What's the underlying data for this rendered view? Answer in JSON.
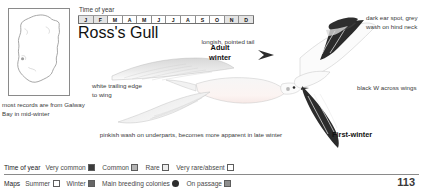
{
  "page": {
    "number": "113"
  },
  "map": {
    "caption": "most records are from Galway Bay in mid-winter"
  },
  "time_of_year": {
    "label": "Time of year",
    "months": [
      {
        "letter": "J",
        "level": 1
      },
      {
        "letter": "F",
        "level": 1
      },
      {
        "letter": "M",
        "level": 0
      },
      {
        "letter": "A",
        "level": 0
      },
      {
        "letter": "M",
        "level": 0
      },
      {
        "letter": "J",
        "level": 0
      },
      {
        "letter": "J",
        "level": 0
      },
      {
        "letter": "A",
        "level": 0
      },
      {
        "letter": "S",
        "level": 0
      },
      {
        "letter": "O",
        "level": 0
      },
      {
        "letter": "N",
        "level": 1
      },
      {
        "letter": "D",
        "level": 1
      }
    ]
  },
  "species": {
    "title": "Ross's Gull"
  },
  "annotations": {
    "adult_winter": "Adult\nwinter",
    "adult_winter_line1": "Adult",
    "adult_winter_line2": "winter",
    "first_winter": "First-winter",
    "white_trailing_edge": "white trailing edge to wing",
    "longish_pointed_tail": "longish, pointed tail",
    "pinkish_wash": "pinkish wash on underparts, becomes more apparent in late winter",
    "dark_ear_spot": "dark ear spot, grey wash on hind neck",
    "black_w": "black W across wings"
  },
  "legend_time_of_year": {
    "head": "Time of year",
    "items": [
      {
        "label": "Very common",
        "swatch": "very-common",
        "color": "#3b3b3b"
      },
      {
        "label": "Common",
        "swatch": "common",
        "color": "#b4b4b4"
      },
      {
        "label": "Rare",
        "swatch": "rare",
        "color": "#ececec"
      },
      {
        "label": "Very rare/absent",
        "swatch": "absent",
        "color": "#ffffff"
      }
    ]
  },
  "legend_maps": {
    "head": "Maps",
    "items": [
      {
        "label": "Summer",
        "swatch": "summer",
        "color": "#ffffff"
      },
      {
        "label": "Winter",
        "swatch": "winter",
        "color": "#666666"
      },
      {
        "label": "Main breeding colonies",
        "swatch": "colony-dot",
        "color": "#2d2d2d"
      },
      {
        "label": "On passage",
        "swatch": "passage",
        "color": "#8e8e8e"
      }
    ]
  }
}
